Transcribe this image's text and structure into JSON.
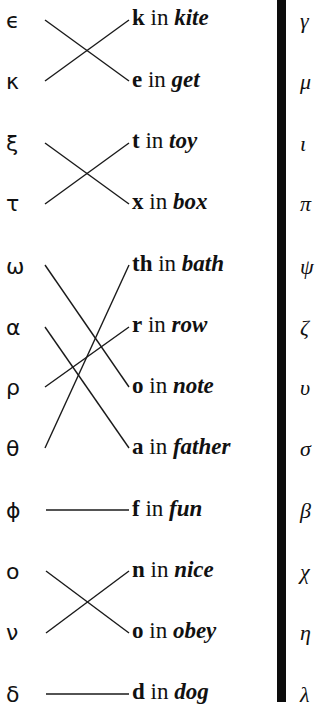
{
  "left_column": [
    {
      "symbol": "ϵ",
      "y": 10
    },
    {
      "symbol": "κ",
      "y": 71
    },
    {
      "symbol": "ξ",
      "y": 133
    },
    {
      "symbol": "τ",
      "y": 193
    },
    {
      "symbol": "ω",
      "y": 256
    },
    {
      "symbol": "α",
      "y": 317
    },
    {
      "symbol": "ρ",
      "y": 377
    },
    {
      "symbol": "θ",
      "y": 438
    },
    {
      "symbol": "ϕ",
      "y": 500
    },
    {
      "symbol": "ο",
      "y": 561
    },
    {
      "symbol": "ν",
      "y": 622
    },
    {
      "symbol": "δ",
      "y": 684
    }
  ],
  "middle_column": [
    {
      "letter": "k",
      "in": " in ",
      "word": "kite",
      "y": 6
    },
    {
      "letter": "e",
      "in": " in ",
      "word": "get",
      "y": 68
    },
    {
      "letter": "t",
      "in": " in ",
      "word": "toy",
      "y": 129
    },
    {
      "letter": "x",
      "in": " in ",
      "word": "box",
      "y": 190
    },
    {
      "letter": "th",
      "in": " in ",
      "word": "bath",
      "y": 252
    },
    {
      "letter": "r",
      "in": " in ",
      "word": "row",
      "y": 313
    },
    {
      "letter": "o",
      "in": " in ",
      "word": "note",
      "y": 374
    },
    {
      "letter": "a",
      "in": " in ",
      "word": "father",
      "y": 435
    },
    {
      "letter": "f",
      "in": " in ",
      "word": "fun",
      "y": 497
    },
    {
      "letter": "n",
      "in": " in ",
      "word": "nice",
      "y": 558
    },
    {
      "letter": "o",
      "in": " in ",
      "word": "obey",
      "y": 619
    },
    {
      "letter": "d",
      "in": " in ",
      "word": "dog",
      "y": 680
    }
  ],
  "right_column": [
    {
      "symbol": "γ",
      "y": 10
    },
    {
      "symbol": "μ",
      "y": 71
    },
    {
      "symbol": "ι",
      "y": 133
    },
    {
      "symbol": "π",
      "y": 193
    },
    {
      "symbol": "ψ",
      "y": 256
    },
    {
      "symbol": "ζ",
      "y": 317
    },
    {
      "symbol": "υ",
      "y": 377
    },
    {
      "symbol": "σ",
      "y": 438
    },
    {
      "symbol": "β",
      "y": 500
    },
    {
      "symbol": "χ",
      "y": 561
    },
    {
      "symbol": "η",
      "y": 622
    },
    {
      "symbol": "λ",
      "y": 684
    }
  ],
  "connections": [
    {
      "from": "ϵ",
      "to": "e in get"
    },
    {
      "from": "κ",
      "to": "k in kite"
    },
    {
      "from": "ξ",
      "to": "x in box"
    },
    {
      "from": "τ",
      "to": "t in toy"
    },
    {
      "from": "ω",
      "to": "o in note"
    },
    {
      "from": "α",
      "to": "a in father"
    },
    {
      "from": "ρ",
      "to": "r in row"
    },
    {
      "from": "θ",
      "to": "th in bath"
    },
    {
      "from": "ϕ",
      "to": "f in fun"
    },
    {
      "from": "ο",
      "to": "o in obey"
    },
    {
      "from": "ν",
      "to": "n in nice"
    },
    {
      "from": "δ",
      "to": "d in dog"
    }
  ],
  "colors": {
    "ink": "#111111",
    "bar": "#0c0c0c",
    "background": "#ffffff"
  }
}
